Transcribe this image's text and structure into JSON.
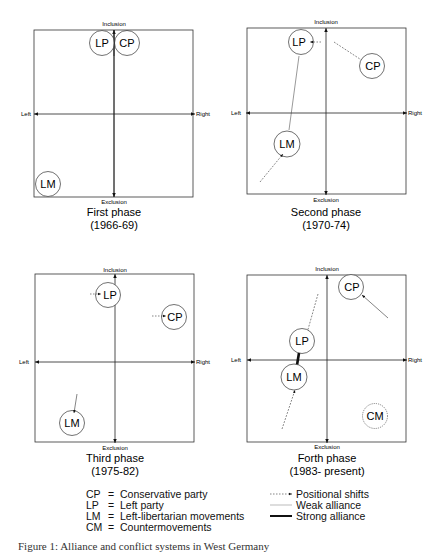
{
  "axes": {
    "top": "Inclusion",
    "bottom": "Exclusion",
    "left": "Left",
    "right": "Right"
  },
  "panels": [
    {
      "title": "First phase",
      "period": "(1966-69)",
      "nodes": [
        {
          "id": "LP",
          "label": "LP"
        },
        {
          "id": "CP",
          "label": "CP"
        },
        {
          "id": "LM",
          "label": "LM"
        }
      ]
    },
    {
      "title": "Second phase",
      "period": "(1970-74)",
      "nodes": [
        {
          "id": "LP",
          "label": "LP"
        },
        {
          "id": "CP",
          "label": "CP"
        },
        {
          "id": "LM",
          "label": "LM"
        }
      ]
    },
    {
      "title": "Third phase",
      "period": "(1975-82)",
      "nodes": [
        {
          "id": "LP",
          "label": "LP"
        },
        {
          "id": "CP",
          "label": "CP"
        },
        {
          "id": "LM",
          "label": "LM"
        }
      ]
    },
    {
      "title": "Forth phase",
      "period": "(1983- present)",
      "nodes": [
        {
          "id": "LP",
          "label": "LP"
        },
        {
          "id": "CP",
          "label": "CP"
        },
        {
          "id": "LM",
          "label": "LM"
        },
        {
          "id": "CM",
          "label": "CM"
        }
      ]
    }
  ],
  "legend_abbreviations": [
    {
      "abbr": "CP",
      "eq": "=",
      "meaning": "Conservative party"
    },
    {
      "abbr": "LP",
      "eq": "=",
      "meaning": "Left party"
    },
    {
      "abbr": "LM",
      "eq": "=",
      "meaning": "Left-libertarian movements"
    },
    {
      "abbr": "CM",
      "eq": "=",
      "meaning": "Countermovements"
    }
  ],
  "legend_lines": [
    {
      "label": "Positional shifts",
      "style": "dashed-arrow"
    },
    {
      "label": "Weak alliance",
      "style": "thin-line"
    },
    {
      "label": "Strong alliance",
      "style": "thick-line"
    }
  ],
  "caption": "Figure 1: Alliance and conflict systems in West Germany"
}
